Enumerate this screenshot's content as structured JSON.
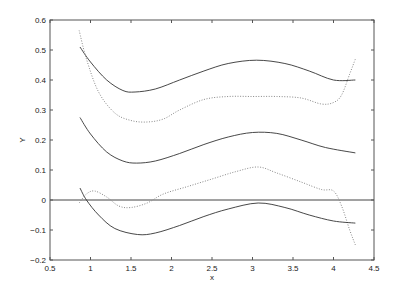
{
  "chart_data": {
    "type": "line",
    "title": "",
    "xlabel": "x",
    "ylabel": "Y",
    "xlim": [
      0.5,
      4.5
    ],
    "ylim": [
      -0.2,
      0.6
    ],
    "xticks": [
      "0.5",
      "1",
      "1.5",
      "2",
      "2.5",
      "3",
      "3.5",
      "4",
      "4.5"
    ],
    "yticks": [
      "-0.2",
      "-0.1",
      "0",
      "0.1",
      "0.2",
      "0.3",
      "0.4",
      "0.5",
      "0.6"
    ],
    "grid": false,
    "legend": null,
    "reference_line": {
      "y": 0,
      "style": "solid"
    },
    "series": [
      {
        "name": "upper solid",
        "style": "solid",
        "x": [
          0.87,
          1.0,
          1.2,
          1.4,
          1.55,
          1.8,
          2.1,
          2.4,
          2.7,
          3.05,
          3.4,
          3.7,
          4.0,
          4.27
        ],
        "y": [
          0.51,
          0.46,
          0.4,
          0.365,
          0.36,
          0.37,
          0.4,
          0.43,
          0.455,
          0.466,
          0.455,
          0.43,
          0.4,
          0.4
        ]
      },
      {
        "name": "upper dotted",
        "style": "dotted",
        "x": [
          0.86,
          0.95,
          1.1,
          1.3,
          1.5,
          1.7,
          1.9,
          2.1,
          2.4,
          2.7,
          3.0,
          3.3,
          3.6,
          3.85,
          4.0,
          4.1,
          4.2,
          4.27
        ],
        "y": [
          0.565,
          0.47,
          0.36,
          0.29,
          0.265,
          0.26,
          0.27,
          0.3,
          0.335,
          0.345,
          0.345,
          0.345,
          0.34,
          0.32,
          0.325,
          0.35,
          0.42,
          0.47
        ]
      },
      {
        "name": "middle solid",
        "style": "solid",
        "x": [
          0.87,
          1.0,
          1.2,
          1.4,
          1.57,
          1.8,
          2.1,
          2.4,
          2.7,
          3.0,
          3.3,
          3.6,
          3.9,
          4.27
        ],
        "y": [
          0.275,
          0.22,
          0.16,
          0.13,
          0.123,
          0.13,
          0.155,
          0.185,
          0.21,
          0.225,
          0.222,
          0.2,
          0.175,
          0.157
        ]
      },
      {
        "name": "lower dotted",
        "style": "dotted",
        "x": [
          0.86,
          0.95,
          1.05,
          1.2,
          1.35,
          1.5,
          1.7,
          1.9,
          2.2,
          2.5,
          2.8,
          3.07,
          3.3,
          3.6,
          3.85,
          4.0,
          4.1,
          4.2,
          4.27
        ],
        "y": [
          -0.01,
          0.02,
          0.03,
          0.01,
          -0.02,
          -0.025,
          -0.01,
          0.02,
          0.045,
          0.07,
          0.095,
          0.11,
          0.09,
          0.06,
          0.035,
          0.03,
          -0.02,
          -0.1,
          -0.15
        ]
      },
      {
        "name": "lower solid",
        "style": "solid",
        "x": [
          0.87,
          0.95,
          1.1,
          1.3,
          1.58,
          1.8,
          2.1,
          2.4,
          2.7,
          3.07,
          3.4,
          3.7,
          4.0,
          4.27
        ],
        "y": [
          0.04,
          0.0,
          -0.05,
          -0.095,
          -0.115,
          -0.11,
          -0.085,
          -0.055,
          -0.03,
          -0.01,
          -0.025,
          -0.05,
          -0.07,
          -0.077
        ]
      }
    ]
  },
  "plot_area": {
    "left": 50,
    "top": 20,
    "right": 374,
    "bottom": 260
  },
  "colors": {
    "axis": "#555555",
    "solid_line": "#333333",
    "dotted_line": "#888888",
    "zero_line": "#444444"
  }
}
